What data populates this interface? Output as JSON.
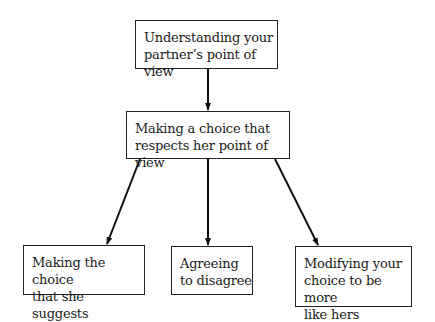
{
  "nodes": {
    "top": {
      "line1": "Understanding your",
      "line2": "partner’s point of view"
    },
    "middle": {
      "line1": "Making a choice that",
      "line2": "respects her point of view"
    },
    "left": {
      "line1": "Making the choice",
      "line2": "that she suggests"
    },
    "center": {
      "line1": "Agreeing",
      "line2": "to disagree"
    },
    "right": {
      "line1": "Modifying your",
      "line2": "choice to be more",
      "line3": "like hers"
    }
  },
  "edges": [
    {
      "from": "top",
      "to": "middle"
    },
    {
      "from": "middle",
      "to": "left"
    },
    {
      "from": "middle",
      "to": "center"
    },
    {
      "from": "middle",
      "to": "right"
    }
  ]
}
